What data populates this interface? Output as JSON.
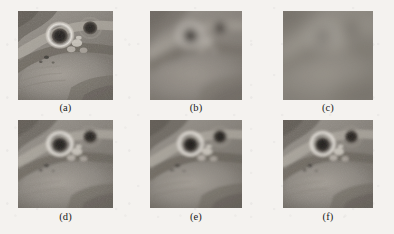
{
  "figure": {
    "kind": "image-grid",
    "rows": 2,
    "columns": 3,
    "background_color": "#f4f2ef",
    "panels": [
      {
        "id": "a",
        "caption": "(a)",
        "description": "original sharp grayscale image, two dark round eyes with bright highlight rings",
        "blur_px": 0.4,
        "contrast": 1.18,
        "brightness": 1.0,
        "noise": 0.14,
        "x": 18,
        "y": 11,
        "w": 95,
        "h": 89,
        "caption_y": 102
      },
      {
        "id": "b",
        "caption": "(b)",
        "description": "heavily blurred / degraded version, eyes barely visible",
        "blur_px": 4.2,
        "contrast": 0.55,
        "brightness": 1.04,
        "noise": 0.05,
        "x": 150,
        "y": 11,
        "w": 92,
        "h": 89,
        "caption_y": 102
      },
      {
        "id": "c",
        "caption": "(c)",
        "description": "most severely blurred version, nearly flat gray field",
        "blur_px": 7.5,
        "contrast": 0.34,
        "brightness": 1.05,
        "noise": 0.035,
        "x": 283,
        "y": 11,
        "w": 90,
        "h": 89,
        "caption_y": 102
      },
      {
        "id": "d",
        "caption": "(d)",
        "description": "restored image, moderately sharp with visible noise grain",
        "blur_px": 1.1,
        "contrast": 1.06,
        "brightness": 1.0,
        "noise": 0.13,
        "x": 18,
        "y": 120,
        "w": 95,
        "h": 88,
        "caption_y": 211
      },
      {
        "id": "e",
        "caption": "(e)",
        "description": "restored image, smoother than (d), eyes well defined",
        "blur_px": 1.5,
        "contrast": 1.02,
        "brightness": 1.01,
        "noise": 0.07,
        "x": 150,
        "y": 120,
        "w": 92,
        "h": 88,
        "caption_y": 211
      },
      {
        "id": "f",
        "caption": "(f)",
        "description": "restored image, similar to (d) with slight grain",
        "blur_px": 1.2,
        "contrast": 1.05,
        "brightness": 1.0,
        "noise": 0.11,
        "x": 283,
        "y": 120,
        "w": 90,
        "h": 88,
        "caption_y": 211
      }
    ]
  }
}
